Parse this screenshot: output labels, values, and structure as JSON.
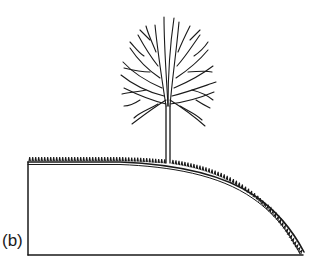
{
  "figure": {
    "panel_label": "(b)",
    "colors": {
      "ink": "#1a1a1a",
      "background": "#ffffff"
    }
  }
}
